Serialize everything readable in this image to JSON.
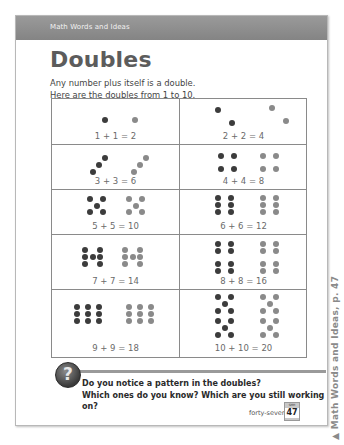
{
  "header": {
    "label": "Math Words and Ideas"
  },
  "title": "Doubles",
  "intro": {
    "line1": "Any number plus itself is a double.",
    "line2": "Here are the doubles from 1 to 10."
  },
  "doubles": [
    {
      "equation": "1 + 1 = 2"
    },
    {
      "equation": "2 + 2 = 4"
    },
    {
      "equation": "3 + 3 = 6"
    },
    {
      "equation": "4 + 4 = 8"
    },
    {
      "equation": "5 + 5 = 10"
    },
    {
      "equation": "6 + 6 = 12"
    },
    {
      "equation": "7 + 7 = 14"
    },
    {
      "equation": "8 + 8 = 16"
    },
    {
      "equation": "9 + 9 = 18"
    },
    {
      "equation": "10 + 10 = 20"
    }
  ],
  "question": {
    "icon": "question-mark-icon",
    "line1": "Do you notice a pattern in the doubles?",
    "line2": "Which ones do you know? Which are you still working on?"
  },
  "footer": {
    "page_word": "forty-seven",
    "badge_label": "SMH",
    "page_number": "47"
  },
  "side_caption": "▲  Math Words and Ideas, p. 47",
  "colors": {
    "header_bg": "#8f8f8f",
    "dot_dark": "#3c3c3c",
    "dot_light": "#8a8a8a"
  }
}
